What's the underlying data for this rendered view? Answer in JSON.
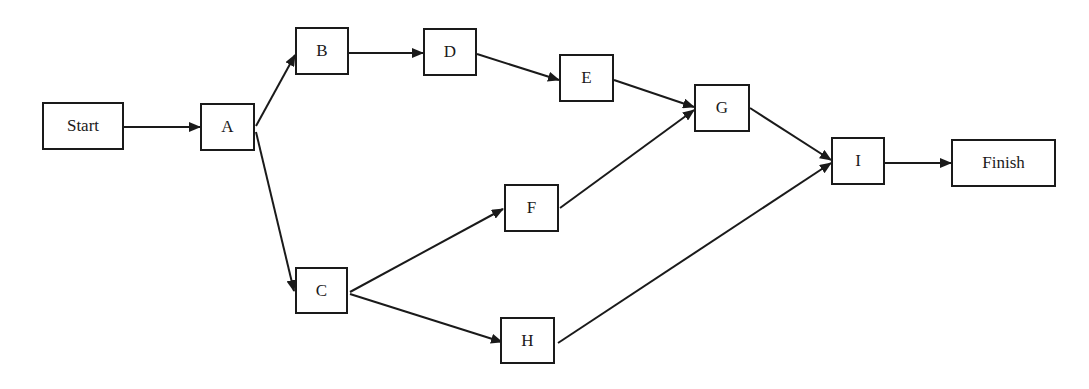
{
  "diagram": {
    "type": "activity-on-node network",
    "nodes": {
      "start": {
        "label": "Start",
        "x": 42,
        "y": 102,
        "w": 82,
        "h": 48
      },
      "a": {
        "label": "A",
        "x": 200,
        "y": 103,
        "w": 55,
        "h": 48
      },
      "b": {
        "label": "B",
        "x": 295,
        "y": 27,
        "w": 54,
        "h": 48
      },
      "c": {
        "label": "C",
        "x": 295,
        "y": 267,
        "w": 53,
        "h": 47
      },
      "d": {
        "label": "D",
        "x": 423,
        "y": 28,
        "w": 54,
        "h": 48
      },
      "e": {
        "label": "E",
        "x": 559,
        "y": 54,
        "w": 55,
        "h": 48
      },
      "f": {
        "label": "F",
        "x": 504,
        "y": 184,
        "w": 55,
        "h": 48
      },
      "g": {
        "label": "G",
        "x": 694,
        "y": 84,
        "w": 56,
        "h": 48
      },
      "h": {
        "label": "H",
        "x": 500,
        "y": 317,
        "w": 55,
        "h": 47
      },
      "i": {
        "label": "I",
        "x": 831,
        "y": 137,
        "w": 54,
        "h": 48
      },
      "finish": {
        "label": "Finish",
        "x": 951,
        "y": 139,
        "w": 105,
        "h": 48
      }
    },
    "edges": [
      {
        "from": "Start",
        "to": "A",
        "x1": 124,
        "y1": 127,
        "x2": 200,
        "y2": 127
      },
      {
        "from": "A",
        "to": "B",
        "x1": 256,
        "y1": 126,
        "x2": 295,
        "y2": 55
      },
      {
        "from": "A",
        "to": "C",
        "x1": 256,
        "y1": 132,
        "x2": 294,
        "y2": 291
      },
      {
        "from": "B",
        "to": "D",
        "x1": 349,
        "y1": 53,
        "x2": 423,
        "y2": 53
      },
      {
        "from": "D",
        "to": "E",
        "x1": 477,
        "y1": 54,
        "x2": 559,
        "y2": 80
      },
      {
        "from": "E",
        "to": "G",
        "x1": 614,
        "y1": 80,
        "x2": 694,
        "y2": 107
      },
      {
        "from": "F",
        "to": "G",
        "x1": 560,
        "y1": 208,
        "x2": 694,
        "y2": 110
      },
      {
        "from": "C",
        "to": "F",
        "x1": 350,
        "y1": 292,
        "x2": 503,
        "y2": 209
      },
      {
        "from": "C",
        "to": "H",
        "x1": 350,
        "y1": 294,
        "x2": 502,
        "y2": 342
      },
      {
        "from": "G",
        "to": "I",
        "x1": 750,
        "y1": 108,
        "x2": 831,
        "y2": 160
      },
      {
        "from": "H",
        "to": "I",
        "x1": 558,
        "y1": 343,
        "x2": 831,
        "y2": 163
      },
      {
        "from": "I",
        "to": "Finish",
        "x1": 885,
        "y1": 163,
        "x2": 951,
        "y2": 163
      }
    ],
    "colors": {
      "stroke": "#1a1a1a",
      "background": "#ffffff"
    }
  }
}
